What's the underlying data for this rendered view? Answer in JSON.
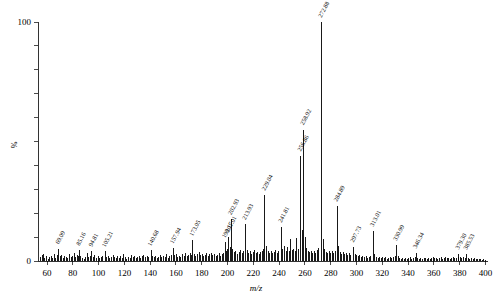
{
  "chart_data": {
    "type": "bar",
    "title": "",
    "subtitle": "",
    "xlabel": "m/z",
    "ylabel": "%",
    "xlim": [
      53,
      402
    ],
    "ylim": [
      0,
      100
    ],
    "grid": false,
    "legend": null,
    "x_ticks": [
      60,
      80,
      100,
      120,
      140,
      160,
      180,
      200,
      220,
      240,
      260,
      280,
      300,
      320,
      340,
      360,
      380,
      400
    ],
    "x_tick_labels": [
      "60",
      "80",
      "100",
      "120",
      "140",
      "160",
      "180",
      "200",
      "220",
      "240",
      "260",
      "280",
      "300",
      "320",
      "340",
      "360",
      "380",
      "400"
    ],
    "y_ticks": [
      0,
      10,
      20,
      30,
      40,
      50,
      60,
      70,
      80,
      90,
      100
    ],
    "y_tick_labels": [
      "0",
      "",
      "",
      "",
      "",
      "",
      "",
      "",
      "",
      "",
      "100"
    ],
    "y_major_labels": [
      "0",
      "100"
    ],
    "annotations": [
      {
        "mz": 69.09,
        "label": "69.09"
      },
      {
        "mz": 85.16,
        "label": "85.16"
      },
      {
        "mz": 94.81,
        "label": "94.81"
      },
      {
        "mz": 105.21,
        "label": "105.21"
      },
      {
        "mz": 140.68,
        "label": "140.68"
      },
      {
        "mz": 157.94,
        "label": "157.94"
      },
      {
        "mz": 173.05,
        "label": "173.05"
      },
      {
        "mz": 198.17,
        "label": "198.17"
      },
      {
        "mz": 201.01,
        "label": "201.01"
      },
      {
        "mz": 202.93,
        "label": "202.93"
      },
      {
        "mz": 213.93,
        "label": "213.93"
      },
      {
        "mz": 229.04,
        "label": "229.04"
      },
      {
        "mz": 241.81,
        "label": "241.81"
      },
      {
        "mz": 256.86,
        "label": "256.86"
      },
      {
        "mz": 258.92,
        "label": "258.92"
      },
      {
        "mz": 272.88,
        "label": "272.88"
      },
      {
        "mz": 284.89,
        "label": "284.89"
      },
      {
        "mz": 297.73,
        "label": "297.73"
      },
      {
        "mz": 313.01,
        "label": "313.01"
      },
      {
        "mz": 330.99,
        "label": "330.99"
      },
      {
        "mz": 346.34,
        "label": "346.34"
      },
      {
        "mz": 379.3,
        "label": "379.30"
      },
      {
        "mz": 385.53,
        "label": "385.53"
      }
    ],
    "peaks": [
      [
        55.1,
        1.6
      ],
      [
        56.3,
        2.4
      ],
      [
        57.2,
        3.1
      ],
      [
        58.4,
        1.2
      ],
      [
        59.6,
        2.0
      ],
      [
        60.8,
        1.0
      ],
      [
        61.9,
        1.5
      ],
      [
        63.1,
        2.2
      ],
      [
        64.3,
        1.1
      ],
      [
        65.5,
        2.8
      ],
      [
        66.7,
        1.4
      ],
      [
        67.8,
        2.6
      ],
      [
        69.09,
        5.2
      ],
      [
        70.3,
        2.0
      ],
      [
        71.5,
        2.4
      ],
      [
        72.6,
        1.3
      ],
      [
        73.8,
        2.1
      ],
      [
        75.0,
        1.7
      ],
      [
        76.2,
        1.2
      ],
      [
        77.4,
        2.9
      ],
      [
        78.6,
        1.5
      ],
      [
        79.8,
        2.3
      ],
      [
        81.0,
        3.4
      ],
      [
        82.2,
        1.8
      ],
      [
        83.3,
        2.6
      ],
      [
        84.2,
        2.2
      ],
      [
        85.16,
        4.6
      ],
      [
        86.3,
        2.0
      ],
      [
        87.5,
        1.4
      ],
      [
        88.7,
        1.0
      ],
      [
        89.9,
        1.6
      ],
      [
        91.1,
        3.2
      ],
      [
        92.3,
        1.5
      ],
      [
        93.5,
        2.1
      ],
      [
        94.81,
        4.2
      ],
      [
        96.0,
        1.8
      ],
      [
        97.2,
        2.5
      ],
      [
        98.4,
        1.4
      ],
      [
        99.6,
        1.9
      ],
      [
        100.8,
        1.2
      ],
      [
        102.0,
        1.7
      ],
      [
        103.2,
        2.3
      ],
      [
        105.21,
        4.0
      ],
      [
        106.4,
        1.6
      ],
      [
        107.6,
        2.2
      ],
      [
        108.8,
        1.3
      ],
      [
        110.0,
        1.8
      ],
      [
        111.2,
        2.6
      ],
      [
        112.4,
        1.5
      ],
      [
        113.6,
        1.1
      ],
      [
        114.8,
        1.9
      ],
      [
        116.0,
        1.4
      ],
      [
        117.2,
        2.1
      ],
      [
        118.4,
        1.2
      ],
      [
        119.6,
        2.8
      ],
      [
        120.8,
        1.5
      ],
      [
        122.0,
        1.0
      ],
      [
        123.2,
        1.8
      ],
      [
        124.4,
        1.3
      ],
      [
        125.6,
        2.4
      ],
      [
        126.8,
        1.6
      ],
      [
        128.0,
        2.0
      ],
      [
        129.2,
        1.2
      ],
      [
        130.4,
        1.7
      ],
      [
        131.6,
        2.3
      ],
      [
        132.8,
        1.4
      ],
      [
        134.0,
        1.9
      ],
      [
        135.2,
        2.6
      ],
      [
        136.4,
        1.5
      ],
      [
        137.6,
        2.1
      ],
      [
        138.8,
        1.8
      ],
      [
        140.68,
        4.4
      ],
      [
        141.9,
        2.2
      ],
      [
        143.1,
        1.6
      ],
      [
        144.3,
        2.0
      ],
      [
        145.5,
        1.3
      ],
      [
        146.7,
        1.8
      ],
      [
        147.9,
        2.5
      ],
      [
        149.1,
        1.5
      ],
      [
        150.3,
        2.2
      ],
      [
        151.5,
        1.7
      ],
      [
        152.7,
        2.9
      ],
      [
        153.9,
        1.4
      ],
      [
        155.1,
        2.0
      ],
      [
        156.3,
        2.7
      ],
      [
        157.94,
        5.4
      ],
      [
        159.1,
        2.4
      ],
      [
        160.3,
        3.0
      ],
      [
        161.5,
        1.8
      ],
      [
        162.7,
        2.2
      ],
      [
        163.9,
        1.5
      ],
      [
        165.1,
        2.8
      ],
      [
        166.3,
        2.0
      ],
      [
        167.5,
        3.4
      ],
      [
        168.7,
        2.1
      ],
      [
        169.9,
        2.6
      ],
      [
        171.1,
        3.2
      ],
      [
        172.3,
        2.4
      ],
      [
        173.05,
        8.6
      ],
      [
        174.3,
        3.0
      ],
      [
        175.5,
        2.2
      ],
      [
        176.7,
        2.8
      ],
      [
        177.9,
        3.6
      ],
      [
        179.1,
        2.4
      ],
      [
        180.3,
        3.0
      ],
      [
        181.5,
        2.0
      ],
      [
        182.7,
        2.6
      ],
      [
        183.9,
        3.2
      ],
      [
        185.1,
        2.2
      ],
      [
        186.3,
        2.8
      ],
      [
        187.5,
        3.4
      ],
      [
        188.7,
        2.4
      ],
      [
        189.9,
        3.0
      ],
      [
        191.1,
        2.1
      ],
      [
        192.3,
        2.7
      ],
      [
        193.5,
        3.3
      ],
      [
        194.7,
        2.3
      ],
      [
        195.9,
        2.9
      ],
      [
        197.0,
        3.5
      ],
      [
        198.17,
        7.8
      ],
      [
        199.3,
        4.2
      ],
      [
        200.1,
        5.0
      ],
      [
        201.01,
        10.2
      ],
      [
        202.0,
        6.0
      ],
      [
        202.93,
        17.5
      ],
      [
        204.1,
        5.2
      ],
      [
        205.3,
        3.6
      ],
      [
        206.5,
        4.2
      ],
      [
        207.7,
        3.0
      ],
      [
        208.9,
        3.8
      ],
      [
        210.1,
        4.6
      ],
      [
        211.3,
        3.2
      ],
      [
        212.5,
        4.0
      ],
      [
        213.93,
        15.4
      ],
      [
        215.1,
        4.6
      ],
      [
        216.3,
        3.4
      ],
      [
        217.5,
        4.0
      ],
      [
        218.7,
        3.0
      ],
      [
        219.9,
        3.6
      ],
      [
        221.1,
        4.4
      ],
      [
        222.3,
        3.2
      ],
      [
        223.5,
        3.8
      ],
      [
        224.7,
        3.0
      ],
      [
        225.9,
        3.6
      ],
      [
        227.1,
        4.2
      ],
      [
        228.0,
        5.0
      ],
      [
        229.04,
        27.6
      ],
      [
        230.2,
        6.2
      ],
      [
        231.4,
        4.0
      ],
      [
        232.6,
        3.4
      ],
      [
        233.8,
        4.0
      ],
      [
        235.0,
        3.2
      ],
      [
        236.2,
        3.8
      ],
      [
        237.4,
        4.4
      ],
      [
        238.6,
        3.4
      ],
      [
        239.8,
        4.2
      ],
      [
        241.81,
        14.2
      ],
      [
        243.0,
        5.0
      ],
      [
        244.2,
        6.4
      ],
      [
        245.4,
        4.2
      ],
      [
        246.6,
        5.8
      ],
      [
        247.8,
        4.0
      ],
      [
        249.0,
        9.0
      ],
      [
        250.2,
        4.4
      ],
      [
        251.4,
        5.2
      ],
      [
        252.6,
        4.0
      ],
      [
        253.8,
        9.6
      ],
      [
        255.0,
        5.0
      ],
      [
        256.86,
        44.0
      ],
      [
        258.0,
        13.0
      ],
      [
        258.92,
        55.0
      ],
      [
        260.1,
        10.0
      ],
      [
        261.3,
        5.4
      ],
      [
        262.5,
        4.2
      ],
      [
        263.7,
        3.6
      ],
      [
        264.9,
        4.2
      ],
      [
        266.1,
        3.4
      ],
      [
        267.3,
        4.0
      ],
      [
        268.5,
        3.2
      ],
      [
        269.7,
        4.6
      ],
      [
        270.9,
        5.4
      ],
      [
        272.88,
        100.0
      ],
      [
        274.1,
        9.0
      ],
      [
        275.3,
        5.0
      ],
      [
        276.5,
        3.8
      ],
      [
        277.7,
        3.2
      ],
      [
        278.9,
        4.0
      ],
      [
        280.1,
        3.4
      ],
      [
        281.3,
        4.2
      ],
      [
        282.5,
        3.2
      ],
      [
        283.7,
        4.0
      ],
      [
        284.89,
        23.0
      ],
      [
        286.1,
        6.2
      ],
      [
        287.3,
        3.6
      ],
      [
        288.5,
        3.0
      ],
      [
        289.7,
        3.6
      ],
      [
        290.9,
        2.8
      ],
      [
        292.1,
        3.4
      ],
      [
        293.3,
        2.6
      ],
      [
        294.5,
        3.2
      ],
      [
        295.7,
        2.4
      ],
      [
        297.73,
        6.0
      ],
      [
        299.0,
        3.0
      ],
      [
        300.2,
        2.4
      ],
      [
        301.4,
        2.0
      ],
      [
        302.6,
        2.6
      ],
      [
        303.8,
        1.8
      ],
      [
        305.0,
        2.2
      ],
      [
        306.2,
        1.6
      ],
      [
        307.4,
        2.0
      ],
      [
        308.6,
        1.4
      ],
      [
        309.8,
        1.8
      ],
      [
        311.0,
        2.2
      ],
      [
        313.01,
        12.6
      ],
      [
        314.3,
        3.0
      ],
      [
        315.5,
        1.8
      ],
      [
        316.7,
        1.4
      ],
      [
        317.9,
        1.8
      ],
      [
        319.1,
        1.2
      ],
      [
        320.3,
        1.6
      ],
      [
        321.5,
        1.1
      ],
      [
        322.7,
        1.5
      ],
      [
        323.9,
        1.0
      ],
      [
        325.1,
        1.4
      ],
      [
        326.3,
        1.8
      ],
      [
        327.5,
        1.2
      ],
      [
        328.7,
        1.6
      ],
      [
        329.9,
        2.0
      ],
      [
        330.99,
        6.6
      ],
      [
        332.2,
        2.2
      ],
      [
        333.4,
        1.4
      ],
      [
        334.6,
        1.0
      ],
      [
        335.8,
        1.3
      ],
      [
        337.0,
        0.9
      ],
      [
        338.2,
        1.2
      ],
      [
        339.4,
        0.8
      ],
      [
        340.6,
        1.1
      ],
      [
        341.8,
        1.5
      ],
      [
        343.0,
        1.0
      ],
      [
        344.2,
        1.3
      ],
      [
        345.4,
        1.6
      ],
      [
        346.34,
        3.4
      ],
      [
        347.6,
        1.4
      ],
      [
        348.8,
        1.0
      ],
      [
        350.0,
        1.2
      ],
      [
        351.2,
        0.8
      ],
      [
        352.4,
        1.1
      ],
      [
        353.6,
        1.4
      ],
      [
        354.8,
        1.0
      ],
      [
        356.0,
        1.2
      ],
      [
        357.2,
        0.9
      ],
      [
        358.4,
        1.3
      ],
      [
        359.6,
        1.6
      ],
      [
        360.8,
        1.1
      ],
      [
        362.0,
        1.4
      ],
      [
        363.2,
        0.9
      ],
      [
        364.4,
        1.2
      ],
      [
        365.6,
        1.5
      ],
      [
        366.8,
        1.0
      ],
      [
        368.0,
        1.3
      ],
      [
        369.2,
        1.7
      ],
      [
        370.4,
        1.1
      ],
      [
        371.6,
        1.4
      ],
      [
        372.8,
        1.0
      ],
      [
        374.0,
        1.2
      ],
      [
        375.2,
        1.6
      ],
      [
        376.4,
        1.1
      ],
      [
        377.6,
        1.4
      ],
      [
        378.8,
        1.8
      ],
      [
        379.3,
        3.0
      ],
      [
        380.6,
        1.5
      ],
      [
        381.8,
        1.2
      ],
      [
        383.0,
        1.6
      ],
      [
        384.2,
        1.3
      ],
      [
        385.53,
        2.8
      ],
      [
        386.8,
        1.4
      ],
      [
        388.0,
        1.0
      ],
      [
        389.2,
        1.3
      ],
      [
        390.4,
        0.9
      ],
      [
        391.6,
        1.1
      ],
      [
        392.8,
        0.8
      ],
      [
        394.0,
        1.0
      ],
      [
        395.2,
        0.7
      ],
      [
        396.4,
        0.9
      ],
      [
        397.6,
        0.6
      ],
      [
        398.8,
        0.8
      ],
      [
        400.0,
        0.5
      ]
    ]
  },
  "figure": {
    "background_color": "#ffffff",
    "line_color": "#000000"
  }
}
